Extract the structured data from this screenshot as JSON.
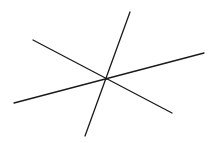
{
  "diagram": {
    "type": "concurrent-lines",
    "canvas": {
      "width": 216,
      "height": 143,
      "background": "#ffffff"
    },
    "stroke": {
      "color": "#1a1a1a",
      "width": 1.3
    },
    "intersection": {
      "x": 106,
      "y": 79
    },
    "lines": [
      {
        "id": "line-a",
        "x1": 130,
        "y1": 12,
        "x2": 85,
        "y2": 136
      },
      {
        "id": "line-b",
        "x1": 14,
        "y1": 103,
        "x2": 204,
        "y2": 53
      },
      {
        "id": "line-c",
        "x1": 33,
        "y1": 40,
        "x2": 172,
        "y2": 113
      }
    ],
    "labels": []
  }
}
